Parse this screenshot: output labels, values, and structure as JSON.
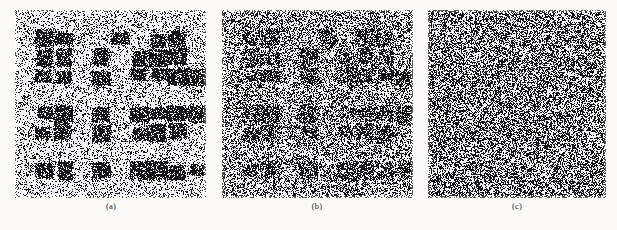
{
  "figure": {
    "background_color": "#fbfaf8",
    "ink_color": "#121212",
    "paper_color": "#f7f6f3",
    "kind": "scanned-figure-three-panel-noise-degradation",
    "panels": [
      {
        "id": "panel-a",
        "caption": "(a)",
        "x": 15,
        "y": 10,
        "width": 191,
        "height": 188,
        "caption_x": 93,
        "caption_y": 201,
        "caption_width": 36,
        "noise_level": 0.3,
        "block_ink": 0.92,
        "background_ink": 0.14,
        "seed": 101
      },
      {
        "id": "panel-b",
        "caption": "(b)",
        "x": 222,
        "y": 10,
        "width": 191,
        "height": 188,
        "caption_x": 299,
        "caption_y": 201,
        "caption_width": 36,
        "noise_level": 0.52,
        "block_ink": 0.88,
        "background_ink": 0.34,
        "seed": 202
      },
      {
        "id": "panel-c",
        "caption": "(c)",
        "x": 428,
        "y": 10,
        "width": 178,
        "height": 188,
        "caption_x": 499,
        "caption_y": 201,
        "caption_width": 36,
        "noise_level": 0.88,
        "block_ink": 0.62,
        "background_ink": 0.52,
        "seed": 303
      }
    ],
    "grid": {
      "cols": 10,
      "rows": 10,
      "description": "underlying block pattern of dark squares on light ground",
      "cells": [
        [
          0,
          0,
          0,
          0,
          0,
          0,
          0,
          0,
          0,
          0
        ],
        [
          0,
          1,
          1,
          0,
          0,
          1,
          0,
          1,
          1,
          0,
          0
        ],
        [
          0,
          1,
          1,
          0,
          1,
          0,
          1,
          1,
          1,
          0,
          1
        ],
        [
          0,
          1,
          1,
          0,
          1,
          0,
          1,
          1,
          1,
          1,
          1
        ],
        [
          0,
          0,
          0,
          0,
          0,
          0,
          0,
          0,
          0,
          0
        ],
        [
          0,
          1,
          1,
          0,
          1,
          0,
          1,
          1,
          1,
          1,
          1
        ],
        [
          0,
          1,
          1,
          0,
          1,
          0,
          1,
          1,
          1,
          0,
          1
        ],
        [
          0,
          0,
          0,
          0,
          0,
          0,
          0,
          0,
          0,
          0
        ],
        [
          0,
          1,
          1,
          0,
          1,
          0,
          1,
          1,
          1,
          1,
          0
        ],
        [
          0,
          0,
          0,
          0,
          0,
          0,
          0,
          0,
          0,
          0
        ]
      ]
    }
  }
}
